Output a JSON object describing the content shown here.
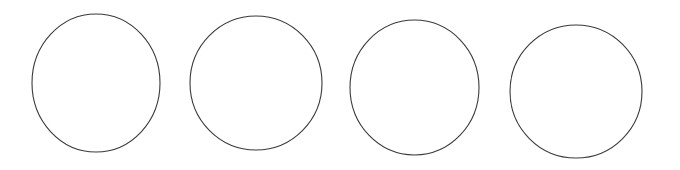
{
  "canvas": {
    "width": 680,
    "height": 170,
    "background_color": "#ffffff",
    "description": "Four outlined circles arranged in a horizontal row on a plain white background"
  },
  "style": {
    "stroke_color": "#3a3a3a",
    "stroke_width": 1.1,
    "fill": "none"
  },
  "shapes": [
    {
      "name": "circle-1",
      "type": "circle",
      "index": 1,
      "cx": 96,
      "cy": 83,
      "rx": 64,
      "ry": 69,
      "left": 32,
      "right": 160,
      "top": 14,
      "bottom": 152,
      "stroke_color": "#3a3a3a",
      "stroke_width": 1.1,
      "fill": "none"
    },
    {
      "name": "circle-2",
      "type": "circle",
      "index": 2,
      "cx": 256,
      "cy": 83,
      "rx": 66,
      "ry": 67,
      "left": 190,
      "right": 322,
      "top": 16,
      "bottom": 150,
      "stroke_color": "#3a3a3a",
      "stroke_width": 1.1,
      "fill": "none"
    },
    {
      "name": "circle-3",
      "type": "circle",
      "index": 3,
      "cx": 414.5,
      "cy": 87.5,
      "rx": 64.5,
      "ry": 67.5,
      "left": 350,
      "right": 479,
      "top": 20,
      "bottom": 155,
      "stroke_color": "#3a3a3a",
      "stroke_width": 1.1,
      "fill": "none"
    },
    {
      "name": "circle-4",
      "type": "circle",
      "index": 4,
      "cx": 576,
      "cy": 91.5,
      "rx": 66,
      "ry": 66.5,
      "left": 510,
      "right": 642,
      "top": 25,
      "bottom": 158,
      "stroke_color": "#3a3a3a",
      "stroke_width": 1.1,
      "fill": "none"
    }
  ]
}
